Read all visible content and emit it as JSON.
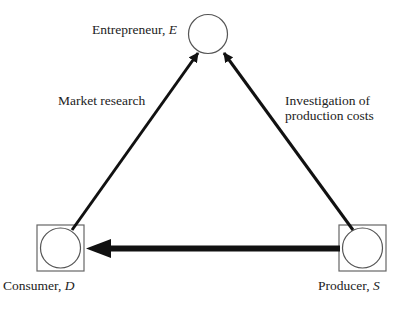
{
  "diagram": {
    "type": "flow-triangle",
    "nodes": [
      {
        "id": "E",
        "name": "Entrepreneur",
        "symbol": "E",
        "shape": "circle"
      },
      {
        "id": "D",
        "name": "Consumer",
        "symbol": "D",
        "shape": "circle-in-square"
      },
      {
        "id": "S",
        "name": "Producer",
        "symbol": "S",
        "shape": "circle-in-square"
      }
    ],
    "edges": [
      {
        "from": "D",
        "to": "E",
        "label": "Market research",
        "weight": "thin"
      },
      {
        "from": "S",
        "to": "E",
        "label": "Investigation of production costs",
        "weight": "thin"
      },
      {
        "from": "S",
        "to": "D",
        "label": "",
        "weight": "thick"
      }
    ]
  },
  "labels": {
    "entrepreneur_name": "Entrepreneur, ",
    "entrepreneur_sym": "E",
    "consumer_name": "Consumer, ",
    "consumer_sym": "D",
    "producer_name": "Producer, ",
    "producer_sym": "S",
    "market_research": "Market research",
    "investigation_line1": "Investigation of",
    "investigation_line2": "production costs"
  },
  "colors": {
    "stroke": "#111111",
    "node_stroke": "#555555",
    "background": "#ffffff"
  }
}
